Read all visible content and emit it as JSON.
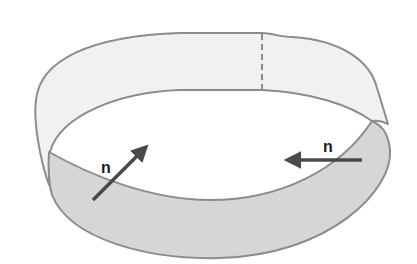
{
  "figure": {
    "colors": {
      "background": "#ffffff",
      "top_band_fill": "#f1f1f1",
      "lower_band_fill": "#d6d6d6",
      "edge_stroke": "#8c8c8c",
      "dashed_seam": "#8c8c8c",
      "arrow": "#4a4a4a",
      "label": "#1a1a1a"
    },
    "normals": [
      {
        "label": "n",
        "from": [
          93,
          200
        ],
        "to": [
          146,
          147
        ],
        "label_pos": [
          101,
          173
        ]
      },
      {
        "label": "n",
        "from": [
          362,
          160
        ],
        "to": [
          287,
          160
        ],
        "label_pos": [
          323,
          152
        ]
      }
    ]
  }
}
